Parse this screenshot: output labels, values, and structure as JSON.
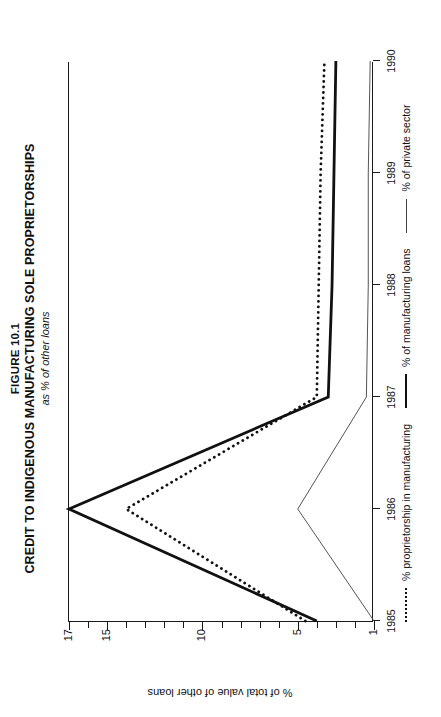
{
  "figure": {
    "number": "FIGURE 10.1",
    "title": "CREDIT TO INDIGENOUS MANUFACTURING SOLE PROPRIETORSHIPS",
    "subtitle": "as % of other loans"
  },
  "axes": {
    "ylabel": "% of total value of other loans",
    "yticks": [
      "17",
      "15",
      "10",
      "5",
      "1"
    ],
    "xticks": [
      "1985",
      "1986",
      "1987",
      "1988",
      "1989",
      "1990"
    ]
  },
  "legend": [
    {
      "label": "% proprietorship in manufacturing",
      "style": "dotted"
    },
    {
      "label": "% of manufacturing loans",
      "style": "thick"
    },
    {
      "label": "% of private sector",
      "style": "thin"
    }
  ],
  "chart_data": {
    "type": "line",
    "title": "CREDIT TO INDIGENOUS MANUFACTURING SOLE PROPRIETORSHIPS",
    "subtitle": "as % of other loans",
    "xlabel": "",
    "ylabel": "% of total value of other loans",
    "x": [
      "1985",
      "1986",
      "1987",
      "1988",
      "1989",
      "1990"
    ],
    "ylim": [
      1,
      17
    ],
    "yticks": [
      1,
      5,
      10,
      15,
      17
    ],
    "grid": false,
    "legend_position": "bottom",
    "series": [
      {
        "name": "% of manufacturing loans",
        "style": "solid-thick",
        "values": [
          4.0,
          17.0,
          3.4,
          3.2,
          3.1,
          3.0
        ]
      },
      {
        "name": "% proprietorship in manufacturing",
        "style": "dotted",
        "values": [
          4.6,
          14.0,
          4.0,
          3.9,
          3.8,
          3.6
        ]
      },
      {
        "name": "% of private sector",
        "style": "solid-thin",
        "values": [
          1.0,
          5.0,
          1.4,
          1.3,
          1.3,
          1.2
        ]
      }
    ]
  }
}
